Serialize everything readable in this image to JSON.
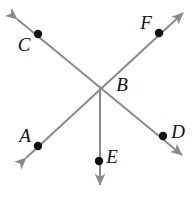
{
  "figure": {
    "type": "geometry-diagram",
    "canvas": {
      "width": 196,
      "height": 199
    },
    "background_color": "#ffffff",
    "line_color": "#8a8a8a",
    "point_color": "#111111",
    "label_color": "#101010",
    "line_width": 2,
    "point_radius": 4.2,
    "labels": {
      "a": "A",
      "b": "B",
      "c": "C",
      "d": "D",
      "e": "E",
      "f": "F"
    },
    "points": [
      {
        "name": "A",
        "label": "A",
        "x": 38,
        "y": 146,
        "label_x": 25,
        "label_y": 138
      },
      {
        "name": "B",
        "label": "B",
        "x": 100,
        "y": 86,
        "label_x": 122,
        "label_y": 87,
        "is_intersection": true,
        "has_dot": false
      },
      {
        "name": "C",
        "label": "C",
        "x": 38,
        "y": 34,
        "label_x": 24,
        "label_y": 47
      },
      {
        "name": "D",
        "label": "D",
        "x": 163,
        "y": 136,
        "label_x": 178,
        "label_y": 134
      },
      {
        "name": "E",
        "label": "E",
        "x": 99,
        "y": 161,
        "label_x": 112,
        "label_y": 159
      },
      {
        "name": "F",
        "label": "F",
        "x": 159,
        "y": 33,
        "label_x": 146,
        "label_y": 25
      }
    ],
    "lines": [
      {
        "name": "line-CD",
        "through": [
          "C",
          "B",
          "D"
        ],
        "x1": 17,
        "y1": 19,
        "x2": 182,
        "y2": 155,
        "arrow_start": true,
        "arrow_end": true
      },
      {
        "name": "line-AF",
        "through": [
          "A",
          "B",
          "F"
        ],
        "x1": 26,
        "y1": 158,
        "x2": 183,
        "y2": 13,
        "arrow_start": true,
        "arrow_end": true
      },
      {
        "name": "ray-BE",
        "through": [
          "B",
          "E"
        ],
        "x1": 100,
        "y1": 86,
        "x2": 100,
        "y2": 185,
        "arrow_start": false,
        "arrow_end": true
      }
    ]
  }
}
